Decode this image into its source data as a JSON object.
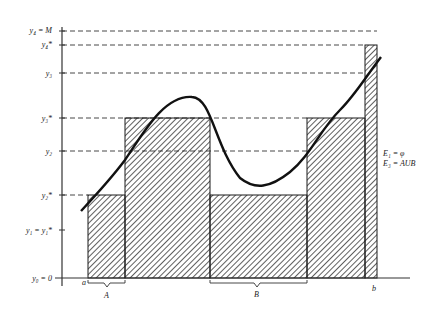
{
  "diagram": {
    "type": "lower-upper-step-function-approximation",
    "y_axis_labels": [
      {
        "key": "y4M",
        "text": "y₄ = M",
        "y": 31
      },
      {
        "key": "y4s",
        "text": "y₄*",
        "y": 45
      },
      {
        "key": "y3",
        "text": "y₃",
        "y": 73
      },
      {
        "key": "y3s",
        "text": "y₃*",
        "y": 118
      },
      {
        "key": "y2",
        "text": "y₂",
        "y": 151
      },
      {
        "key": "y2s",
        "text": "y₂*",
        "y": 195
      },
      {
        "key": "y1",
        "text": "y₁ = y₁*",
        "y": 230
      },
      {
        "key": "y0",
        "text": "y₀ = 0",
        "y": 278
      }
    ],
    "x_labels": {
      "a": "a",
      "b": "b"
    },
    "brace_labels": {
      "A": "A",
      "B": "B"
    },
    "legend": {
      "line1": "E₁ = φ",
      "line2": "E₃ = AUB"
    },
    "rectangles": [
      {
        "x0": 88,
        "x1": 125,
        "top": 195,
        "label": "y2*"
      },
      {
        "x0": 125,
        "x1": 210,
        "top": 118,
        "label": "y3*"
      },
      {
        "x0": 210,
        "x1": 307,
        "top": 195,
        "label": "y2*"
      },
      {
        "x0": 307,
        "x1": 365,
        "top": 118,
        "label": "y3*"
      },
      {
        "x0": 365,
        "x1": 377,
        "top": 45,
        "label": "y4*"
      }
    ],
    "colors": {
      "ink": "#1a1a1a",
      "background": "#ffffff"
    }
  }
}
